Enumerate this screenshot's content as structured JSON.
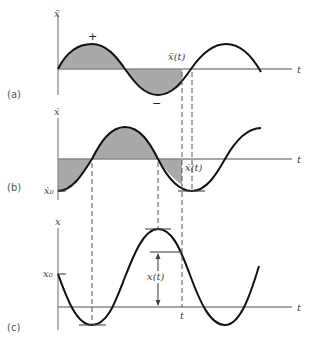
{
  "figure": {
    "panels": [
      {
        "id": "a",
        "panel_label": "(a)",
        "y_axis_label": "ẍ",
        "x_axis_label": "t",
        "curve_label": "ẍ(t)",
        "plus_sign": "+",
        "minus_sign": "−",
        "description": "acceleration, sine wave starting at origin, shaded area from 0 to t"
      },
      {
        "id": "b",
        "panel_label": "(b)",
        "y_axis_label": "ẋ",
        "x_axis_label": "t",
        "curve_label": "ẋ(t)",
        "initial_label": "ẋ₀",
        "description": "velocity, negative cosine starting at ẋ0, shaded area from 0 to t"
      },
      {
        "id": "c",
        "panel_label": "(c)",
        "y_axis_label": "x",
        "x_axis_label": "t",
        "curve_label": "x(t)",
        "initial_label": "x₀",
        "time_marker": "t",
        "description": "displacement, starting at x0, with x(t) dimension arrow at time t"
      }
    ],
    "colors": {
      "curve": "#111111",
      "shade": "#a9a9a9",
      "axis": "#8a8a8a"
    }
  }
}
